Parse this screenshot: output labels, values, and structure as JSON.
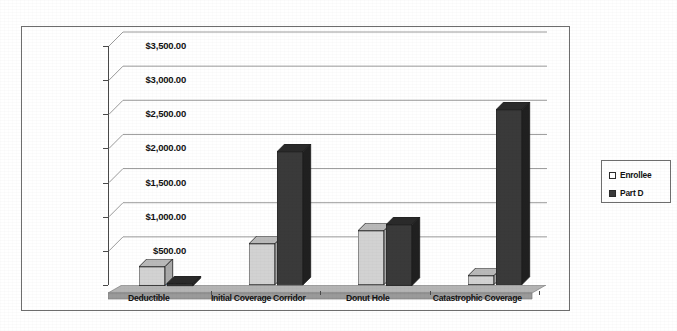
{
  "chart_data": {
    "type": "bar",
    "title": "",
    "subtitle": "",
    "xlabel": "",
    "ylabel": "",
    "categories": [
      "Deductible",
      "Initial Coverage Corridor",
      "Donut Hole",
      "Catastrophic Coverage"
    ],
    "series": [
      {
        "name": "Enrollee",
        "color": "#d2d2d2",
        "values": [
          275,
          600,
          790,
          130
        ]
      },
      {
        "name": "Part D",
        "color": "#3a3a3a",
        "values": [
          15,
          1950,
          890,
          2560
        ]
      }
    ],
    "ylim": [
      0,
      3500
    ],
    "ytick_step": 500,
    "ytick_labels": [
      "$3,500.00",
      "$3,000.00",
      "$2,500.00",
      "$2,000.00",
      "$1,500.00",
      "$1,000.00",
      "$500.00",
      "$0.00"
    ],
    "ytick_values": [
      3500,
      3000,
      2500,
      2000,
      1500,
      1000,
      500,
      0
    ],
    "grid": true,
    "grid_axis": "y",
    "legend_position": "right",
    "legend_entries": [
      {
        "label": "Enrollee",
        "swatch": "light-gray-square"
      },
      {
        "label": "Part D",
        "swatch": "dark-gray-square"
      }
    ],
    "style": "3d-clustered-column",
    "colors": {
      "enrollee_fill": "#d2d2d2",
      "enrollee_top": "#b9b9b9",
      "enrollee_side": "#a9a9a9",
      "partd_fill": "#3a3a3a",
      "partd_top": "#2a2a2a",
      "partd_side": "#202020",
      "gridline": "#8e8e8e",
      "axis": "#4a4a4a",
      "frame": "#6e6e6e",
      "floor": "#9a9a9a",
      "background": "#ffffff"
    }
  }
}
